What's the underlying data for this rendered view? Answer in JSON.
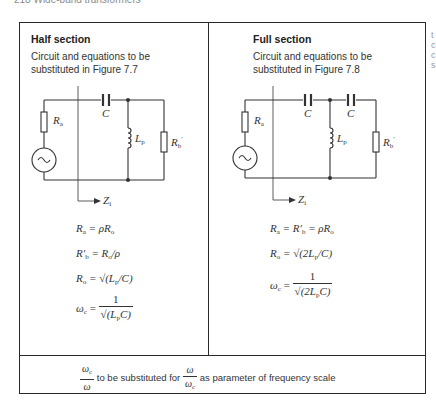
{
  "page": {
    "running_head": "218    Wide-band transformers",
    "margin_fragments": [
      "t",
      "c",
      "c",
      "s"
    ]
  },
  "half_section": {
    "title": "Half section",
    "description": "Circuit and equations to be substituted in Figure 7.7",
    "circuit_labels": {
      "source_resistor": "R",
      "source_resistor_sub": "a",
      "capacitor": "C",
      "inductor": "L",
      "inductor_sub": "p",
      "load_resistor": "R",
      "load_resistor_sub": "b",
      "load_resistor_prime": "′",
      "impedance": "Z",
      "impedance_sub": "i"
    },
    "equations": [
      {
        "lhs": "R",
        "lhs_sub": "a",
        "rhs": "= ρR",
        "rhs_sub": "o"
      },
      {
        "lhs": "R′",
        "lhs_sub": "b",
        "rhs": "= R",
        "rhs_sub": "o",
        "rhs_tail": "/ρ"
      },
      {
        "lhs": "R",
        "lhs_sub": "o",
        "rhs": "= √(L",
        "rhs_sub": "p",
        "rhs_tail": "/C)"
      },
      {
        "lhs": "ω",
        "lhs_sub": "c",
        "numerator": "1",
        "denominator": "√(L",
        "den_sub": "p",
        "den_tail": "C)"
      }
    ]
  },
  "full_section": {
    "title": "Full section",
    "description": "Circuit and equations to be substituted in Figure 7.8",
    "circuit_labels": {
      "source_resistor": "R",
      "source_resistor_sub": "a",
      "capacitor_1": "C",
      "capacitor_2": "C",
      "inductor": "L",
      "inductor_sub": "p",
      "load_resistor": "R",
      "load_resistor_sub": "b",
      "load_resistor_prime": "′",
      "impedance": "Z",
      "impedance_sub": "i"
    },
    "equations": [
      {
        "lhs": "R",
        "lhs_sub": "a",
        "mid": "= R′",
        "mid_sub": "b",
        "rhs": "= ρR",
        "rhs_sub": "o"
      },
      {
        "lhs": "R",
        "lhs_sub": "o",
        "rhs": "= √(2L",
        "rhs_sub": "p",
        "rhs_tail": "/C)"
      },
      {
        "lhs": "ω",
        "lhs_sub": "c",
        "numerator": "1",
        "denominator": "√(2L",
        "den_sub": "p",
        "den_tail": "C)"
      }
    ]
  },
  "footer": {
    "frac1_num": "ω",
    "frac1_num_sub": "c",
    "frac1_den": "ω",
    "text_mid": " to be substituted for ",
    "frac2_num": "ω",
    "frac2_den": "ω",
    "frac2_den_sub": "c",
    "text_end": " as parameter of frequency scale"
  }
}
